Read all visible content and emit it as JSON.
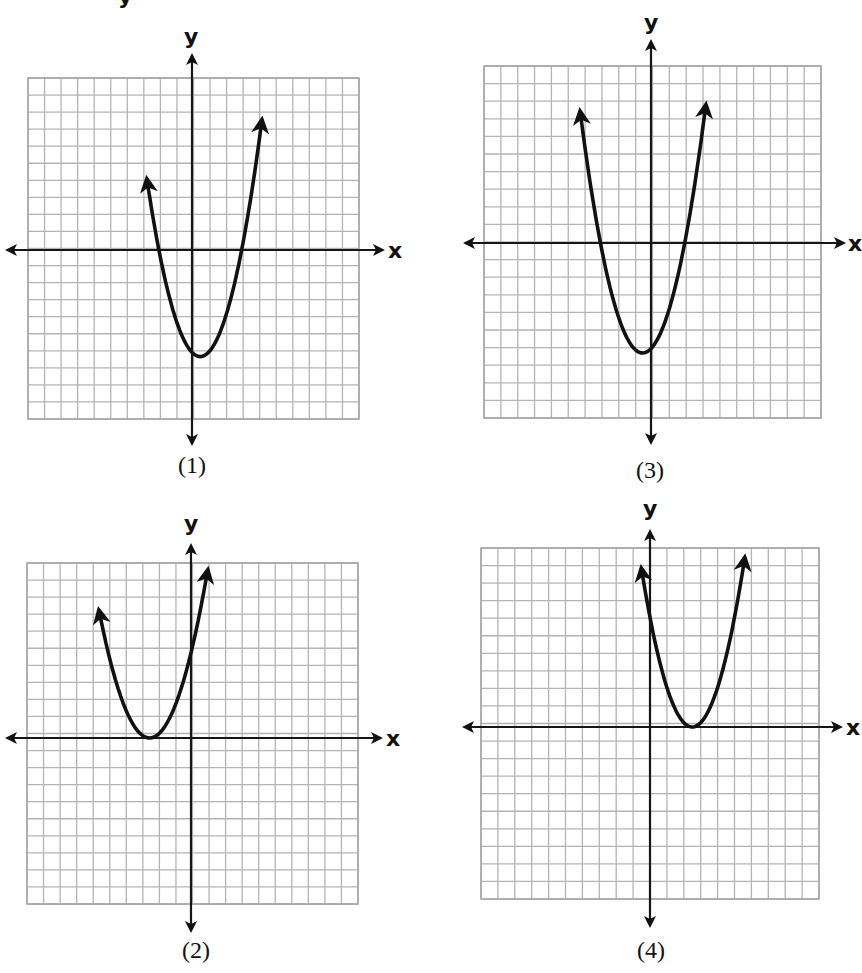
{
  "page": {
    "top_fragment": "y",
    "axis_labels": {
      "x": "x",
      "y": "y"
    }
  },
  "graphs": [
    {
      "id": "graph-1",
      "label": "(1)",
      "grid": {
        "left": 28,
        "top": 78,
        "right": 359,
        "bottom": 419,
        "cells_x": 20,
        "cells_y": 20
      },
      "origin_px": {
        "x": 192,
        "y": 250
      },
      "axis_ext": {
        "left": 8,
        "right": 382,
        "top": 56,
        "bottom": 443
      },
      "x_label_pos": {
        "x": 388,
        "y": 258
      },
      "y_label_pos": {
        "x": 184,
        "y": 44
      },
      "label_pos": {
        "x": 192,
        "y": 473
      },
      "parabola": {
        "a": 1,
        "h": 0.5,
        "k": -6.25,
        "x_start": -2.72,
        "x_end": 4.22
      }
    },
    {
      "id": "graph-3",
      "label": "(3)",
      "grid": {
        "left": 484,
        "top": 66,
        "right": 821,
        "bottom": 418,
        "cells_x": 20,
        "cells_y": 20
      },
      "origin_px": {
        "x": 651,
        "y": 243
      },
      "axis_ext": {
        "left": 466,
        "right": 843,
        "top": 42,
        "bottom": 442
      },
      "x_label_pos": {
        "x": 848,
        "y": 251
      },
      "y_label_pos": {
        "x": 644,
        "y": 30
      },
      "label_pos": {
        "x": 650,
        "y": 478
      },
      "parabola": {
        "a": 1,
        "h": -0.5,
        "k": -6.25,
        "x_start": -4.2,
        "x_end": 3.25
      }
    },
    {
      "id": "graph-2",
      "label": "(2)",
      "grid": {
        "left": 27,
        "top": 563,
        "right": 358,
        "bottom": 904,
        "cells_x": 20,
        "cells_y": 20
      },
      "origin_px": {
        "x": 191,
        "y": 738
      },
      "axis_ext": {
        "left": 8,
        "right": 380,
        "top": 546,
        "bottom": 930
      },
      "x_label_pos": {
        "x": 386,
        "y": 746
      },
      "y_label_pos": {
        "x": 184,
        "y": 531
      },
      "label_pos": {
        "x": 196,
        "y": 958
      },
      "parabola": {
        "a": 0.8,
        "h": -2.5,
        "k": 0,
        "x_start": -5.55,
        "x_end": 1.0
      }
    },
    {
      "id": "graph-4",
      "label": "(4)",
      "grid": {
        "left": 481,
        "top": 548,
        "right": 819,
        "bottom": 899,
        "cells_x": 20,
        "cells_y": 20
      },
      "origin_px": {
        "x": 650,
        "y": 727
      },
      "axis_ext": {
        "left": 465,
        "right": 840,
        "top": 532,
        "bottom": 925
      },
      "x_label_pos": {
        "x": 846,
        "y": 735
      },
      "y_label_pos": {
        "x": 643,
        "y": 516
      },
      "label_pos": {
        "x": 651,
        "y": 958
      },
      "parabola": {
        "a": 1,
        "h": 2.5,
        "k": 0,
        "x_start": -0.5,
        "x_end": 5.6
      }
    }
  ],
  "colors": {
    "grid": "#b4b4b4",
    "axis": "#161616",
    "curve": "#111111",
    "background": "#ffffff"
  }
}
